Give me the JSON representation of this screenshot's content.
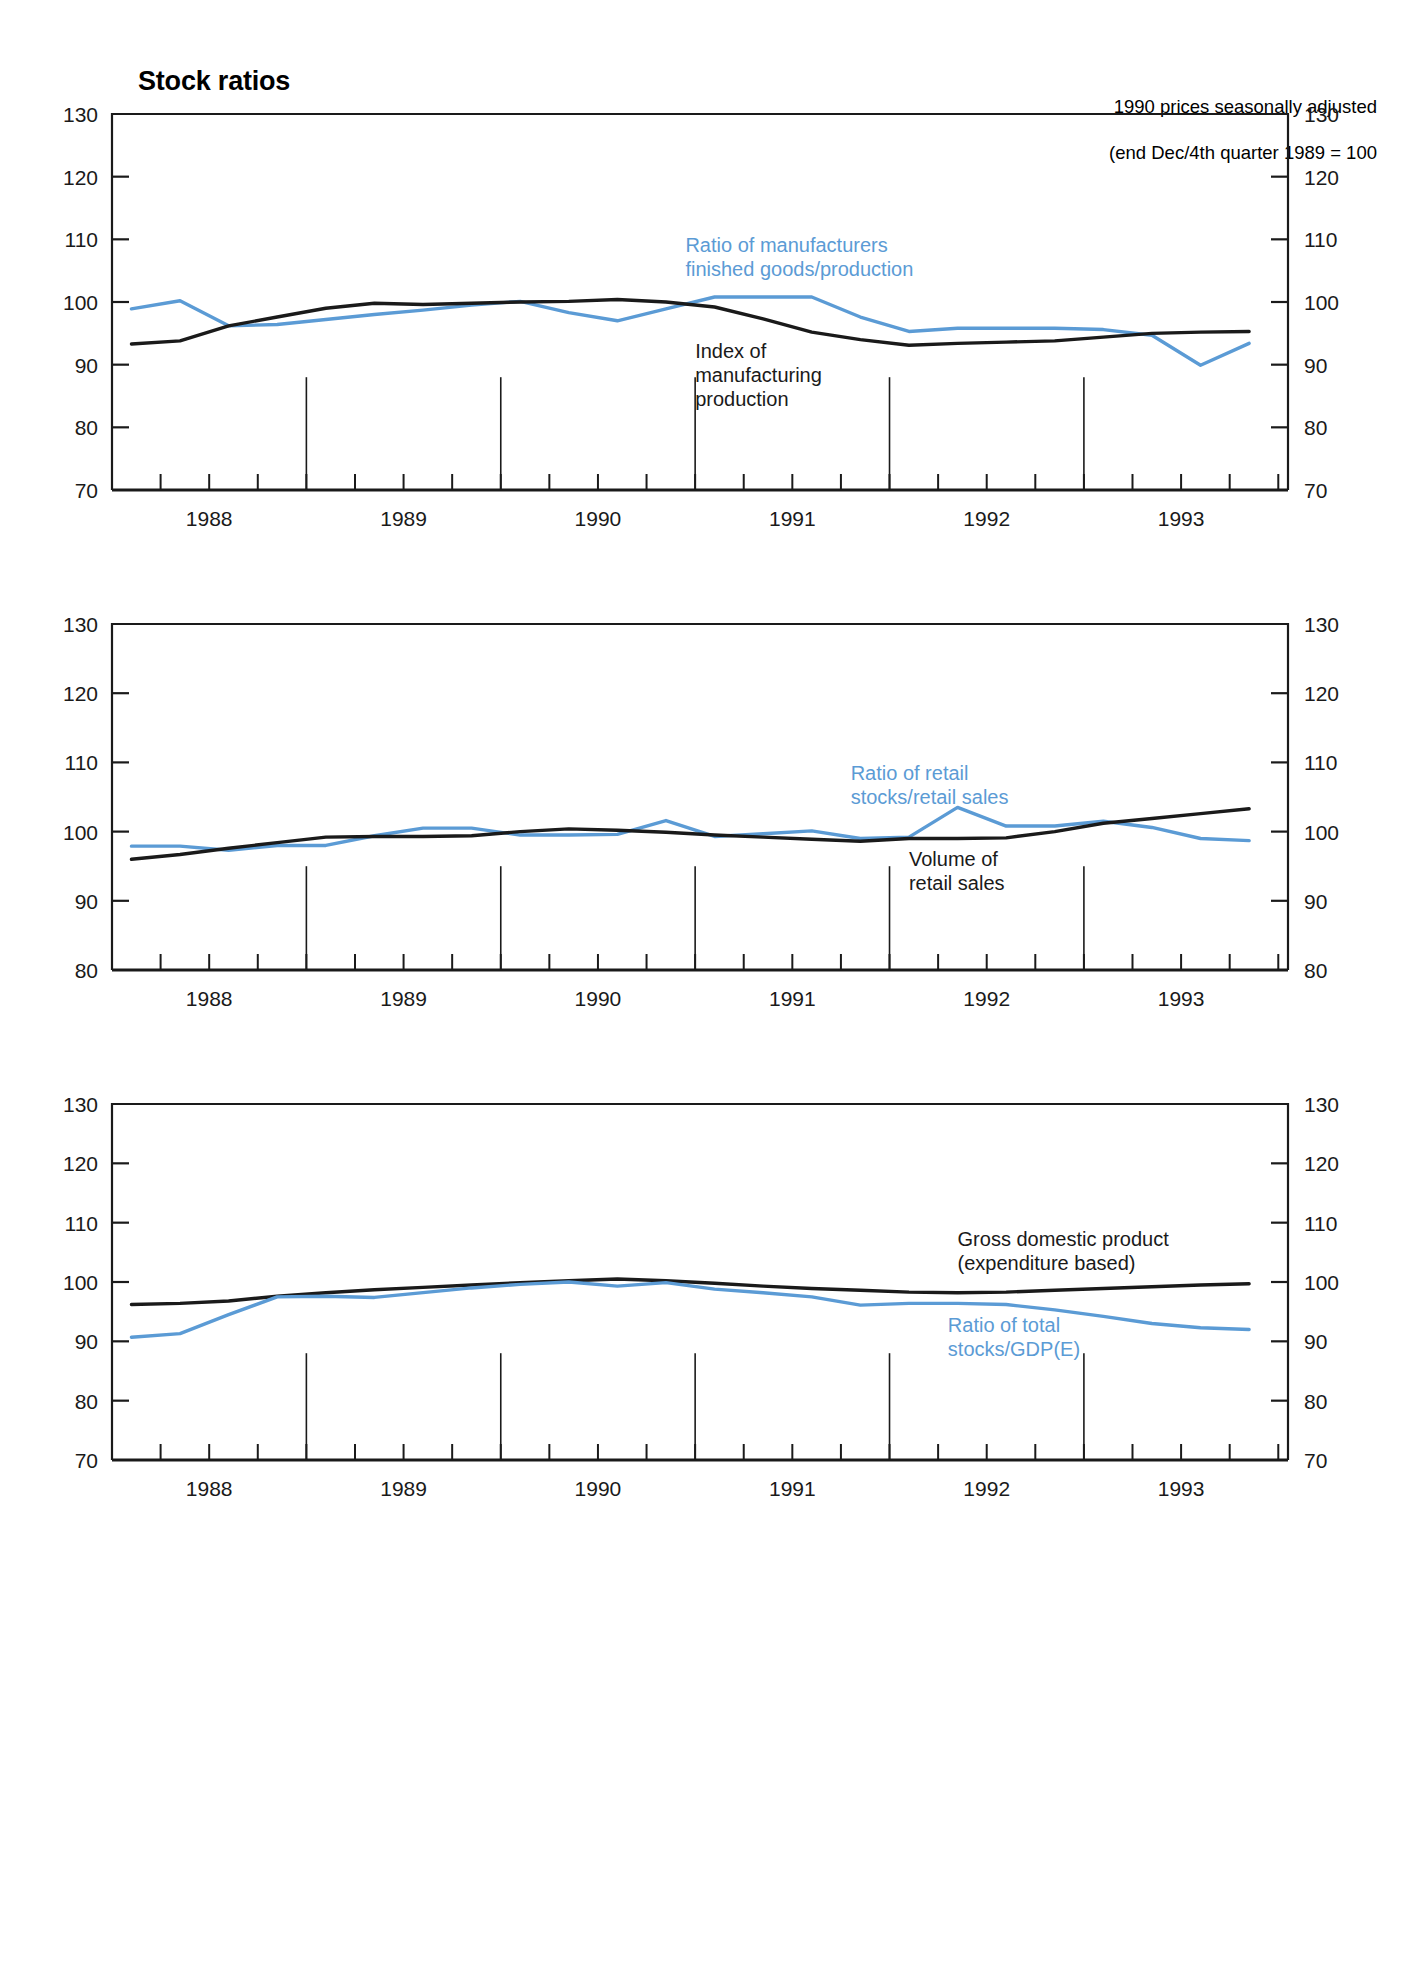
{
  "header": {
    "title": "Stock ratios",
    "subtitle_line1": "1990 prices seasonally adjusted",
    "subtitle_line2": "(end Dec/4th quarter 1989 = 100"
  },
  "colors": {
    "series_blue": "#5b9bd5",
    "series_black": "#1a1a1a",
    "axis": "#1a1a1a",
    "background": "#ffffff"
  },
  "chart_data": [
    {
      "type": "line",
      "title": "Ratio of manufacturers finished goods/production vs Index of manufacturing production",
      "xlabel": "",
      "ylabel": "",
      "ylim": [
        70,
        130
      ],
      "yticks": [
        70,
        80,
        90,
        100,
        110,
        120,
        130
      ],
      "xlim": [
        1987.5,
        1993.55
      ],
      "xticks": [
        1988,
        1989,
        1990,
        1991,
        1992,
        1993
      ],
      "xticklabels": [
        "1988",
        "1989",
        "1990",
        "1991",
        "1992",
        "1993"
      ],
      "minor_xticks": [
        1987.75,
        1988.25,
        1988.5,
        1988.75,
        1989.25,
        1989.5,
        1989.75,
        1990.25,
        1990.5,
        1990.75,
        1991.25,
        1991.5,
        1991.75,
        1992.25,
        1992.5,
        1992.75,
        1993.25,
        1993.5
      ],
      "year_dividers": [
        1988.5,
        1989.5,
        1990.5,
        1991.5,
        1992.5
      ],
      "grid": false,
      "legend_position": "inline-annotations",
      "annotations": [
        {
          "text": "Ratio of manufacturers\nfinished goods/production",
          "color": "#5b9bd5",
          "x": 1990.45,
          "y": 108
        },
        {
          "text": "Index of\nmanufacturing\nproduction",
          "color": "#1a1a1a",
          "x": 1990.5,
          "y": 91
        }
      ],
      "series": [
        {
          "name": "Ratio of manufacturers finished goods/production",
          "color": "#5b9bd5",
          "x": [
            1987.6,
            1987.85,
            1988.1,
            1988.35,
            1988.6,
            1988.85,
            1989.1,
            1989.35,
            1989.6,
            1989.85,
            1990.1,
            1990.35,
            1990.6,
            1990.85,
            1991.1,
            1991.35,
            1991.6,
            1991.85,
            1992.1,
            1992.35,
            1992.6,
            1992.85,
            1993.1,
            1993.35
          ],
          "values": [
            98.9,
            100.2,
            96.2,
            96.4,
            97.2,
            98.0,
            98.7,
            99.5,
            100.1,
            98.3,
            97.0,
            98.9,
            100.8,
            100.8,
            100.8,
            97.6,
            95.3,
            95.8,
            95.8,
            95.8,
            95.6,
            94.7,
            89.9,
            93.4
          ]
        },
        {
          "name": "Index of manufacturing production",
          "color": "#1a1a1a",
          "x": [
            1987.6,
            1987.85,
            1988.1,
            1988.35,
            1988.6,
            1988.85,
            1989.1,
            1989.35,
            1989.6,
            1989.85,
            1990.1,
            1990.35,
            1990.6,
            1990.85,
            1991.1,
            1991.35,
            1991.6,
            1991.85,
            1992.1,
            1992.35,
            1992.6,
            1992.85,
            1993.1,
            1993.35
          ],
          "values": [
            93.3,
            93.8,
            96.2,
            97.6,
            99.0,
            99.8,
            99.6,
            99.8,
            100.0,
            100.1,
            100.4,
            100.0,
            99.2,
            97.3,
            95.2,
            94.0,
            93.1,
            93.4,
            93.6,
            93.8,
            94.4,
            95.0,
            95.2,
            95.3
          ]
        }
      ]
    },
    {
      "type": "line",
      "title": "Ratio of retail stocks/retail sales vs Volume of retail sales",
      "xlabel": "",
      "ylabel": "",
      "ylim": [
        80,
        130
      ],
      "yticks": [
        80,
        90,
        100,
        110,
        120,
        130
      ],
      "xlim": [
        1987.5,
        1993.55
      ],
      "xticks": [
        1988,
        1989,
        1990,
        1991,
        1992,
        1993
      ],
      "xticklabels": [
        "1988",
        "1989",
        "1990",
        "1991",
        "1992",
        "1993"
      ],
      "minor_xticks": [
        1987.75,
        1988.25,
        1988.5,
        1988.75,
        1989.25,
        1989.5,
        1989.75,
        1990.25,
        1990.5,
        1990.75,
        1991.25,
        1991.5,
        1991.75,
        1992.25,
        1992.5,
        1992.75,
        1993.25,
        1993.5
      ],
      "year_dividers": [
        1988.5,
        1989.5,
        1990.5,
        1991.5,
        1992.5
      ],
      "grid": false,
      "legend_position": "inline-annotations",
      "annotations": [
        {
          "text": "Ratio of retail\nstocks/retail sales",
          "color": "#5b9bd5",
          "x": 1991.3,
          "y": 107.5
        },
        {
          "text": "Volume of\nretail sales",
          "color": "#1a1a1a",
          "x": 1991.6,
          "y": 95.0
        }
      ],
      "series": [
        {
          "name": "Ratio of retail stocks/retail sales",
          "color": "#5b9bd5",
          "x": [
            1987.6,
            1987.85,
            1988.1,
            1988.35,
            1988.6,
            1988.85,
            1989.1,
            1989.35,
            1989.6,
            1989.85,
            1990.1,
            1990.35,
            1990.6,
            1990.85,
            1991.1,
            1991.35,
            1991.6,
            1991.85,
            1992.1,
            1992.35,
            1992.6,
            1992.85,
            1993.1,
            1993.35
          ],
          "values": [
            97.9,
            97.9,
            97.3,
            98.0,
            98.0,
            99.4,
            100.5,
            100.5,
            99.5,
            99.5,
            99.6,
            101.6,
            99.3,
            99.7,
            100.1,
            99.0,
            99.2,
            103.5,
            100.8,
            100.8,
            101.5,
            100.6,
            99.0,
            98.7
          ]
        },
        {
          "name": "Volume of retail sales",
          "color": "#1a1a1a",
          "x": [
            1987.6,
            1987.85,
            1988.1,
            1988.35,
            1988.6,
            1988.85,
            1989.1,
            1989.35,
            1989.6,
            1989.85,
            1990.1,
            1990.35,
            1990.6,
            1990.85,
            1991.1,
            1991.35,
            1991.6,
            1991.85,
            1992.1,
            1992.35,
            1992.6,
            1992.85,
            1993.1,
            1993.35
          ],
          "values": [
            96.0,
            96.7,
            97.6,
            98.4,
            99.2,
            99.3,
            99.3,
            99.4,
            100.0,
            100.4,
            100.2,
            99.9,
            99.5,
            99.2,
            98.9,
            98.6,
            99.0,
            99.0,
            99.1,
            100.0,
            101.2,
            101.9,
            102.6,
            103.3
          ]
        }
      ]
    },
    {
      "type": "line",
      "title": "Gross domestic product (expenditure based) vs Ratio of total stocks/GDP(E)",
      "xlabel": "",
      "ylabel": "",
      "ylim": [
        70,
        130
      ],
      "yticks": [
        70,
        80,
        90,
        100,
        110,
        120,
        130
      ],
      "xlim": [
        1987.5,
        1993.55
      ],
      "xticks": [
        1988,
        1989,
        1990,
        1991,
        1992,
        1993
      ],
      "xticklabels": [
        "1988",
        "1989",
        "1990",
        "1991",
        "1992",
        "1993"
      ],
      "minor_xticks": [
        1987.75,
        1988.25,
        1988.5,
        1988.75,
        1989.25,
        1989.5,
        1989.75,
        1990.25,
        1990.5,
        1990.75,
        1991.25,
        1991.5,
        1991.75,
        1992.25,
        1992.5,
        1992.75,
        1993.25,
        1993.5
      ],
      "year_dividers": [
        1988.5,
        1989.5,
        1990.5,
        1991.5,
        1992.5
      ],
      "grid": false,
      "legend_position": "inline-annotations",
      "annotations": [
        {
          "text": "Gross domestic product\n(expenditure based)",
          "color": "#1a1a1a",
          "x": 1991.85,
          "y": 106
        },
        {
          "text": "Ratio of total\nstocks/GDP(E)",
          "color": "#5b9bd5",
          "x": 1991.8,
          "y": 91.5
        }
      ],
      "series": [
        {
          "name": "Gross domestic product (expenditure based)",
          "color": "#1a1a1a",
          "x": [
            1987.6,
            1987.85,
            1988.1,
            1988.35,
            1988.6,
            1988.85,
            1989.1,
            1989.35,
            1989.6,
            1989.85,
            1990.1,
            1990.35,
            1990.6,
            1990.85,
            1991.1,
            1991.35,
            1991.6,
            1991.85,
            1992.1,
            1992.35,
            1992.6,
            1992.85,
            1993.1,
            1993.35
          ],
          "values": [
            96.2,
            96.4,
            96.8,
            97.6,
            98.2,
            98.7,
            99.1,
            99.5,
            99.9,
            100.2,
            100.5,
            100.2,
            99.8,
            99.3,
            98.9,
            98.6,
            98.3,
            98.2,
            98.3,
            98.6,
            98.9,
            99.2,
            99.5,
            99.7
          ]
        },
        {
          "name": "Ratio of total stocks/GDP(E)",
          "color": "#5b9bd5",
          "x": [
            1987.6,
            1987.85,
            1988.1,
            1988.35,
            1988.6,
            1988.85,
            1989.1,
            1989.35,
            1989.6,
            1989.85,
            1990.1,
            1990.35,
            1990.6,
            1990.85,
            1991.1,
            1991.35,
            1991.6,
            1991.85,
            1992.1,
            1992.35,
            1992.6,
            1992.85,
            1993.1,
            1993.35
          ],
          "values": [
            90.7,
            91.3,
            94.5,
            97.5,
            97.6,
            97.4,
            98.2,
            99.0,
            99.6,
            100.0,
            99.3,
            99.9,
            98.8,
            98.2,
            97.5,
            96.1,
            96.4,
            96.4,
            96.2,
            95.3,
            94.2,
            93.0,
            92.3,
            92.0
          ]
        }
      ]
    }
  ]
}
